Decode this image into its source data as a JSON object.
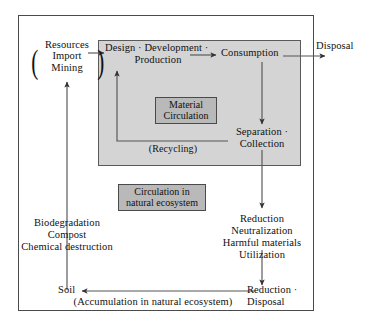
{
  "diagram": {
    "outer_frame_label": "system-boundary",
    "colors": {
      "gray_box_fill": "#d4d4d4",
      "chip_fill": "#b9b9b9",
      "line": "#4a4a4a",
      "text": "#111111",
      "background": "#ffffff"
    }
  },
  "nodes": {
    "resources": "Resources",
    "import": "Import",
    "mining": "Mining",
    "paren_left": "(",
    "paren_right": ")",
    "design": "Design · Development ·",
    "production": "Production",
    "consumption": "Consumption",
    "disposal_top": "Disposal",
    "material_circulation_line1": "Material",
    "material_circulation_line2": "Circulation",
    "recycling": "(Recycling)",
    "separation": "Separation ·",
    "collection": "Collection",
    "circulation_chip_line1": "Circulation in",
    "circulation_chip_line2": "natural ecosystem",
    "biodegradation": "Biodegradation",
    "compost": "Compost",
    "chemical_destruction": "Chemical destruction",
    "reduction": "Reduction",
    "neutralization": "Neutralization",
    "harmful_materials": "Harmful materials",
    "utilization": "Utilization",
    "soil": "Soil",
    "accumulation": "(Accumulation in natural ecosystem)",
    "reduction_bottom": "Reduction ·",
    "disposal_bottom": "Disposal"
  },
  "flows": [
    {
      "id": "soil-to-resources",
      "from": "Soil",
      "to": "Import / Mining",
      "direction": "up"
    },
    {
      "id": "resources-to-design",
      "from": "Resources (Import / Mining)",
      "to": "Design · Development · Production",
      "direction": "right"
    },
    {
      "id": "design-to-consumption",
      "from": "Design · Development · Production",
      "to": "Consumption",
      "direction": "right"
    },
    {
      "id": "consumption-to-disposal",
      "from": "Consumption",
      "to": "Disposal",
      "direction": "right"
    },
    {
      "id": "consumption-to-separation",
      "from": "Consumption",
      "to": "Separation · Collection",
      "direction": "down"
    },
    {
      "id": "recycling-loop",
      "from": "Separation · Collection",
      "to": "Design · Development · Production",
      "direction": "left-up",
      "label": "(Recycling)"
    },
    {
      "id": "separation-to-reduction",
      "from": "Separation · Collection",
      "to": "Reduction / Neutralization / Harmful materials / Utilization",
      "direction": "down"
    },
    {
      "id": "reduction-to-disposal",
      "from": "Reduction / Neutralization / Harmful materials / Utilization",
      "to": "Reduction · Disposal",
      "direction": "down"
    },
    {
      "id": "disposal-to-soil",
      "from": "Reduction · Disposal",
      "to": "Soil",
      "direction": "left"
    }
  ]
}
